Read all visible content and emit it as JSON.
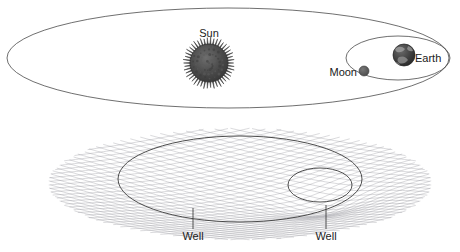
{
  "figure": {
    "title_hidden": "",
    "background_color": "#ffffff",
    "width": 460,
    "height": 252
  },
  "top_panel": {
    "name": "solar-system-orbit-diagram",
    "bodies": [
      {
        "id": "sun",
        "label": "Sun",
        "label_x": 209,
        "label_y": 37,
        "cx": 209,
        "cy": 63,
        "radius": 19,
        "corona_radius": 25,
        "color": "#4a4a4a",
        "corona_color": "#3c3c3c"
      },
      {
        "id": "earth",
        "label": "Earth",
        "label_x": 431,
        "label_y": 62,
        "cx": 404,
        "cy": 55,
        "radius": 11,
        "color": "#3a3a3a"
      },
      {
        "id": "moon",
        "label": "Moon",
        "label_x": 344,
        "label_y": 76,
        "cx": 364,
        "cy": 71,
        "radius": 5,
        "color": "#5a5a5a"
      }
    ],
    "orbits": [
      {
        "id": "earth-orbit-around-sun",
        "cx": 228,
        "cy": 58,
        "rx": 221,
        "ry": 50,
        "stroke": "#4a4a4a"
      },
      {
        "id": "moon-orbit-around-earth",
        "cx": 398,
        "cy": 58,
        "rx": 52,
        "ry": 22,
        "stroke": "#4a4a4a"
      }
    ]
  },
  "bottom_panel": {
    "name": "gravity-well-mesh-diagram",
    "mesh": {
      "id": "spacetime-grid",
      "color": "#7d7d86",
      "cx": 240,
      "cy": 175,
      "rx": 192,
      "ry": 54,
      "lines_u": 34,
      "lines_v": 34
    },
    "wells": [
      {
        "id": "sun-well",
        "label": "Well",
        "label_x": 193,
        "label_y": 240,
        "leader_x": 193,
        "leader_y_top": 208,
        "leader_y_bottom": 229,
        "ellipse_cx": 240,
        "ellipse_cy": 179,
        "ellipse_rx": 122,
        "ellipse_ry": 43,
        "depth": 26
      },
      {
        "id": "earth-well",
        "label": "Well",
        "label_x": 326,
        "label_y": 240,
        "leader_x": 326,
        "leader_y_top": 205,
        "leader_y_bottom": 229,
        "ellipse_cx": 320,
        "ellipse_cy": 185,
        "ellipse_rx": 32,
        "ellipse_ry": 17,
        "depth": 10
      }
    ]
  },
  "colors": {
    "ink": "#1a1a1a",
    "orbit": "#4a4a4a",
    "mesh": "#7d7d86",
    "body_dark": "#3a3a3a",
    "background": "#ffffff"
  }
}
